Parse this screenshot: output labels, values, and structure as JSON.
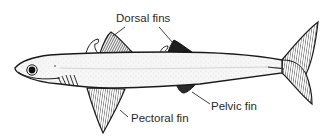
{
  "diagram": {
    "labels": {
      "dorsal": "Dorsal fins",
      "pelvic": "Pelvic fin",
      "pectoral": "Pectoral fin"
    },
    "colors": {
      "ink": "#1a1a1a",
      "body_fill": "#f4f4f4",
      "fin_fill": "#cfcfcf",
      "label_text": "#2a2a2a",
      "background": "#ffffff"
    }
  }
}
